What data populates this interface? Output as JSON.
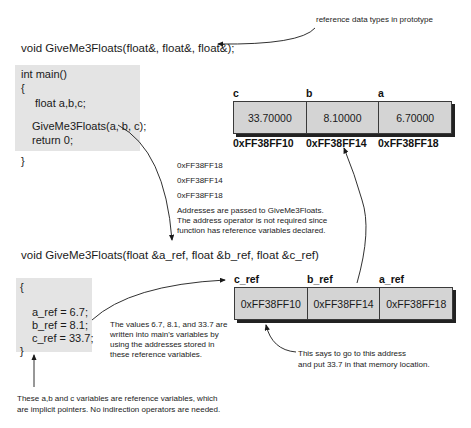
{
  "annotations": {
    "prototype_note": "reference data types in prototype",
    "addresses_passed_note": [
      "Addresses are passed to GiveMe3Floats.",
      "The address operator is not required since",
      "function has reference variables declared."
    ],
    "values_written_note": [
      "The values 6.7, 8.1, and 33.7 are",
      "written into main's variables by",
      "using the addresses stored in",
      "these reference variables."
    ],
    "go_to_address_note": [
      "This says to go to this address",
      "and put 33.7 in that memory location."
    ],
    "reference_variables_note": [
      "These a,b and c variables are reference variables, which",
      "are implicit pointers. No indirection operators are needed."
    ]
  },
  "prototype": "void GiveMe3Floats(float&, float&, float&);",
  "function_header": "void GiveMe3Floats(float &a_ref, float &b_ref, float &c_ref)",
  "main_code": [
    "int main()",
    "{",
    "float a,b,c;",
    "GiveMe3Floats(a, b, c);",
    "return 0;",
    "}"
  ],
  "function_body": [
    "{",
    "a_ref = 6.7;",
    "b_ref = 8.1;",
    "c_ref = 33.7;",
    "}"
  ],
  "passed_addresses": [
    "0xFF38FF18",
    "0xFF38FF14",
    "0xFF38FF18"
  ],
  "main_memory": {
    "cells": [
      {
        "name": "c",
        "value": "33.70000",
        "address": "0xFF38FF10"
      },
      {
        "name": "b",
        "value": "8.10000",
        "address": "0xFF38FF14"
      },
      {
        "name": "a",
        "value": "6.70000",
        "address": "0xFF38FF18"
      }
    ]
  },
  "ref_memory": {
    "cells": [
      {
        "name": "c_ref",
        "value": "0xFF38FF10"
      },
      {
        "name": "b_ref",
        "value": "0xFF38FF14"
      },
      {
        "name": "a_ref",
        "value": "0xFF38FF18"
      }
    ]
  },
  "colors": {
    "box_fill": "#d4d4d4",
    "code_fill": "#e4e4e4",
    "ink": "#1a1a1a"
  }
}
